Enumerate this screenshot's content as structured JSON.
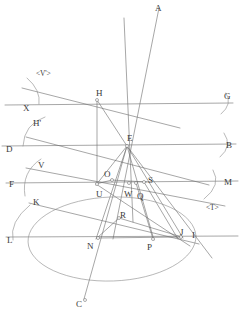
{
  "figure": {
    "kind": "geometry-diagram",
    "width": 245,
    "height": 321,
    "stroke_color": "#6b6b6b",
    "label_color": "#3a3a3a",
    "background": "#ffffff"
  },
  "labels": [
    {
      "id": "A",
      "text": "A",
      "x": 155,
      "y": 4,
      "kind": "point-label"
    },
    {
      "id": "Vp",
      "text": "<V'>",
      "x": 36,
      "y": 70,
      "kind": "angle-tag"
    },
    {
      "id": "H",
      "text": "H",
      "x": 96,
      "y": 89,
      "kind": "point-label"
    },
    {
      "id": "G",
      "text": "G",
      "x": 224,
      "y": 92,
      "kind": "point-label"
    },
    {
      "id": "X",
      "text": "X",
      "x": 23,
      "y": 104,
      "kind": "point-label"
    },
    {
      "id": "Hp",
      "text": "H'",
      "x": 33,
      "y": 119,
      "kind": "point-label"
    },
    {
      "id": "E",
      "text": "E",
      "x": 127,
      "y": 134,
      "kind": "point-label"
    },
    {
      "id": "D",
      "text": "D",
      "x": 6,
      "y": 145,
      "kind": "point-label"
    },
    {
      "id": "B",
      "text": "B",
      "x": 226,
      "y": 141,
      "kind": "point-label"
    },
    {
      "id": "V",
      "text": "V",
      "x": 38,
      "y": 161,
      "kind": "point-label"
    },
    {
      "id": "F",
      "text": "F",
      "x": 9,
      "y": 180,
      "kind": "point-label"
    },
    {
      "id": "O",
      "text": "O",
      "x": 104,
      "y": 170,
      "kind": "point-label"
    },
    {
      "id": "S",
      "text": "S",
      "x": 148,
      "y": 176,
      "kind": "point-label"
    },
    {
      "id": "M",
      "text": "M",
      "x": 224,
      "y": 178,
      "kind": "point-label"
    },
    {
      "id": "U",
      "text": "U",
      "x": 96,
      "y": 190,
      "kind": "point-label"
    },
    {
      "id": "W",
      "text": "W",
      "x": 124,
      "y": 190,
      "kind": "point-label"
    },
    {
      "id": "Q",
      "text": "Q",
      "x": 137,
      "y": 192,
      "kind": "point-label"
    },
    {
      "id": "K",
      "text": "K",
      "x": 33,
      "y": 198,
      "kind": "point-label"
    },
    {
      "id": "R",
      "text": "R",
      "x": 120,
      "y": 211,
      "kind": "point-label"
    },
    {
      "id": "T",
      "text": "<T>",
      "x": 206,
      "y": 204,
      "kind": "angle-tag"
    },
    {
      "id": "J",
      "text": "J",
      "x": 180,
      "y": 228,
      "kind": "point-label"
    },
    {
      "id": "I",
      "text": "I",
      "x": 192,
      "y": 231,
      "kind": "point-label"
    },
    {
      "id": "L",
      "text": "L",
      "x": 7,
      "y": 236,
      "kind": "point-label"
    },
    {
      "id": "N",
      "text": "N",
      "x": 87,
      "y": 242,
      "kind": "point-label"
    },
    {
      "id": "P",
      "text": "P",
      "x": 147,
      "y": 243,
      "kind": "point-label"
    },
    {
      "id": "C",
      "text": "C",
      "x": 76,
      "y": 300,
      "kind": "point-label"
    }
  ],
  "points": [
    {
      "id": "H",
      "x": 97,
      "y": 100,
      "marked": true
    },
    {
      "id": "E",
      "x": 127,
      "y": 146,
      "marked": true
    },
    {
      "id": "O",
      "x": 112,
      "y": 180,
      "marked": true
    },
    {
      "id": "U",
      "x": 97,
      "y": 184,
      "marked": true
    },
    {
      "id": "W",
      "x": 129,
      "y": 183,
      "marked": true
    },
    {
      "id": "Q",
      "x": 136,
      "y": 183,
      "marked": true
    },
    {
      "id": "S",
      "x": 144,
      "y": 182,
      "marked": true
    },
    {
      "id": "R",
      "x": 119,
      "y": 218,
      "marked": true
    },
    {
      "id": "N",
      "x": 98,
      "y": 238,
      "marked": true
    },
    {
      "id": "P",
      "x": 153,
      "y": 239,
      "marked": true
    },
    {
      "id": "J",
      "x": 181,
      "y": 237,
      "marked": true
    },
    {
      "id": "C",
      "x": 85,
      "y": 300,
      "marked": true
    }
  ],
  "lines": [
    {
      "id": "line-XG",
      "x1": 5,
      "y1": 105,
      "x2": 233,
      "y2": 103,
      "note": "horizontal through X and G"
    },
    {
      "id": "line-DB",
      "x1": 2,
      "y1": 146,
      "x2": 236,
      "y2": 144,
      "note": "horizontal through D and B"
    },
    {
      "id": "line-FM",
      "x1": 6,
      "y1": 183,
      "x2": 238,
      "y2": 181,
      "note": "horizontal through F and M"
    },
    {
      "id": "line-LI",
      "x1": 6,
      "y1": 237,
      "x2": 238,
      "y2": 236,
      "note": "horizontal through L, J and I"
    },
    {
      "id": "line-A",
      "x1": 113,
      "y1": 239,
      "x2": 159,
      "y2": 8,
      "note": "oblique ray to A"
    },
    {
      "id": "line-vert",
      "x1": 124,
      "y1": 18,
      "x2": 133,
      "y2": 222,
      "note": "near-vertical through E"
    },
    {
      "id": "line-Vp",
      "x1": 22,
      "y1": 88,
      "x2": 180,
      "y2": 128,
      "note": "oblique line tagged V'"
    },
    {
      "id": "line-Hp",
      "x1": 26,
      "y1": 137,
      "x2": 209,
      "y2": 185,
      "note": "oblique line from H' region"
    },
    {
      "id": "line-V",
      "x1": 26,
      "y1": 168,
      "x2": 225,
      "y2": 206,
      "note": "oblique line tagged V"
    },
    {
      "id": "line-K",
      "x1": 29,
      "y1": 203,
      "x2": 199,
      "y2": 244,
      "note": "oblique line through K"
    },
    {
      "id": "line-EC",
      "x1": 127,
      "y1": 146,
      "x2": 84,
      "y2": 299,
      "note": "segment E to C"
    },
    {
      "id": "line-EN",
      "x1": 127,
      "y1": 146,
      "x2": 96,
      "y2": 239,
      "note": "segment E to N"
    },
    {
      "id": "line-EP",
      "x1": 127,
      "y1": 146,
      "x2": 154,
      "y2": 240,
      "note": "segment E to P"
    },
    {
      "id": "line-EJ",
      "x1": 127,
      "y1": 146,
      "x2": 183,
      "y2": 238,
      "note": "segment E to J"
    },
    {
      "id": "line-EU",
      "x1": 127,
      "y1": 146,
      "x2": 96,
      "y2": 185,
      "note": "segment E to U"
    },
    {
      "id": "line-HE",
      "x1": 97,
      "y1": 100,
      "x2": 127,
      "y2": 146,
      "note": "segment H to E"
    },
    {
      "id": "line-HU",
      "x1": 97,
      "y1": 100,
      "x2": 97,
      "y2": 184,
      "note": "segment H down to U"
    },
    {
      "id": "line-ES",
      "x1": 127,
      "y1": 146,
      "x2": 212,
      "y2": 258,
      "note": "ray E through S region downward"
    },
    {
      "id": "line-UJ",
      "x1": 96,
      "y1": 184,
      "x2": 190,
      "y2": 246,
      "note": "segment U toward J"
    },
    {
      "id": "line-OS",
      "x1": 111,
      "y1": 180,
      "x2": 147,
      "y2": 182,
      "note": "short chord O to S"
    },
    {
      "id": "line-NR",
      "x1": 97,
      "y1": 238,
      "x2": 119,
      "y2": 218,
      "note": "segment N to R"
    },
    {
      "id": "line-RJ",
      "x1": 119,
      "y1": 218,
      "x2": 182,
      "y2": 237,
      "note": "segment R to J"
    },
    {
      "id": "line-NJ",
      "x1": 97,
      "y1": 238,
      "x2": 182,
      "y2": 237,
      "note": "segment N to J"
    },
    {
      "id": "line-OU",
      "x1": 112,
      "y1": 180,
      "x2": 96,
      "y2": 184,
      "note": "segment O to U"
    },
    {
      "id": "line-SJ",
      "x1": 144,
      "y1": 182,
      "x2": 178,
      "y2": 239,
      "note": "segment S down to J"
    },
    {
      "id": "line-QP",
      "x1": 136,
      "y1": 183,
      "x2": 153,
      "y2": 239,
      "note": "segment Q down to P"
    }
  ],
  "curves": [
    {
      "id": "ellipse-base",
      "cx": 112,
      "cy": 239,
      "rx": 84,
      "ry": 42,
      "note": "large base ellipse arc"
    },
    {
      "id": "arc-G",
      "note": "small arc near G"
    },
    {
      "id": "arc-B",
      "note": "small arc near B"
    },
    {
      "id": "arc-M",
      "note": "small arc near M, tagged T"
    },
    {
      "id": "arc-Vp",
      "note": "small arc near X, tagged V prime"
    },
    {
      "id": "arc-Hp",
      "note": "arc from H' down to D"
    },
    {
      "id": "arc-F",
      "note": "arc near F"
    },
    {
      "id": "arc-L",
      "note": "arc near L"
    }
  ]
}
